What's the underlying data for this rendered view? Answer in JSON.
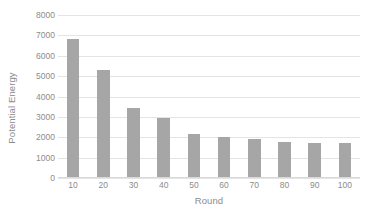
{
  "chart_data": {
    "type": "bar",
    "title": "",
    "xlabel": "Round",
    "ylabel": "Potential Energy",
    "categories": [
      "10",
      "20",
      "30",
      "40",
      "50",
      "60",
      "70",
      "80",
      "90",
      "100"
    ],
    "values": [
      6800,
      5300,
      3450,
      2950,
      2150,
      2000,
      1900,
      1780,
      1730,
      1730
    ],
    "series": [
      {
        "name": "Potential Energy",
        "values": [
          6800,
          5300,
          3450,
          2950,
          2150,
          2000,
          1900,
          1780,
          1730,
          1730
        ]
      }
    ],
    "ylim": [
      0,
      8000
    ],
    "yticks": [
      0,
      1000,
      2000,
      3000,
      4000,
      5000,
      6000,
      7000,
      8000
    ],
    "ytick_labels": [
      "0",
      "1000",
      "2000",
      "3000",
      "4000",
      "5000",
      "6000",
      "7000",
      "8000"
    ],
    "xtick_labels": [
      "10",
      "20",
      "30",
      "40",
      "50",
      "60",
      "70",
      "80",
      "90",
      "100"
    ],
    "grid": "horizontal",
    "legend": "none",
    "bar_color": "#a6a6a6",
    "gridline_color": "#e4e4e4",
    "text_color": "#8c8c8c",
    "background_color": "#ffffff"
  }
}
